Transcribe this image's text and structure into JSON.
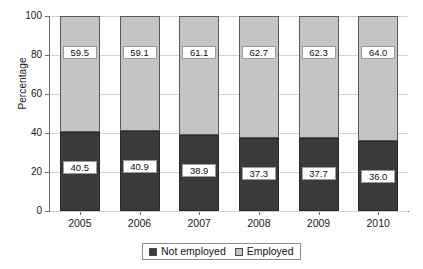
{
  "chart_data": {
    "type": "bar",
    "subtype": "stacked-100-percent",
    "title": "",
    "subtitle": "",
    "xlabel": "",
    "ylabel": "Percentage",
    "categories": [
      "2005",
      "2006",
      "2007",
      "2008",
      "2009",
      "2010"
    ],
    "series": [
      {
        "name": "Not employed",
        "color": "#3a3a3a",
        "values": [
          40.5,
          40.9,
          38.9,
          37.3,
          37.7,
          36.0
        ],
        "labels": [
          "40.5",
          "40.9",
          "38.9",
          "37.3",
          "37.7",
          "36.0"
        ]
      },
      {
        "name": "Employed",
        "color": "#c4c4c4",
        "values": [
          59.5,
          59.1,
          61.1,
          62.7,
          62.3,
          64.0
        ],
        "labels": [
          "59.5",
          "59.1",
          "61.1",
          "62.7",
          "62.3",
          "64.0"
        ]
      }
    ],
    "ylim": [
      0,
      100
    ],
    "yticks": [
      0,
      20,
      40,
      60,
      80,
      100
    ],
    "ytick_labels": [
      "0",
      "20",
      "40",
      "60",
      "80",
      "100"
    ],
    "grid": true,
    "grid_axis": "y",
    "legend_position": "bottom",
    "legend_entries": [
      "Not employed",
      "Employed"
    ],
    "stack_order": [
      "Not employed",
      "Employed"
    ]
  },
  "axes": {
    "y_title": "Percentage"
  },
  "legend": {
    "items": [
      {
        "label": "Not employed",
        "color": "#3a3a3a"
      },
      {
        "label": "Employed",
        "color": "#c4c4c4"
      }
    ]
  },
  "colors": {
    "not_employed": "#3a3a3a",
    "employed": "#c4c4c4",
    "gridline": "#d2d2d2",
    "axis": "#6e6e6e",
    "text": "#1a1a1a",
    "label_background": "#ffffff"
  }
}
